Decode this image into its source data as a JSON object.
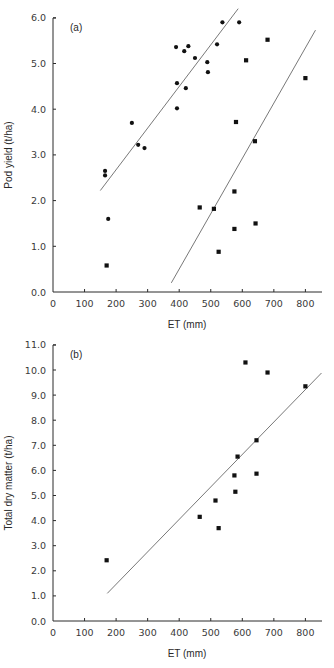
{
  "chart_data": [
    {
      "type": "scatter",
      "panel_label": "(a)",
      "xlabel": "ET (mm)",
      "ylabel": "Pod yield (t/ha)",
      "xlim": [
        0,
        850
      ],
      "ylim": [
        0,
        6.0
      ],
      "xticks": [
        0,
        100,
        200,
        300,
        400,
        500,
        600,
        700,
        800
      ],
      "xtick_labels": [
        "0",
        "100",
        "200",
        "300",
        "400",
        "500",
        "600",
        "700",
        "800"
      ],
      "yticks": [
        0,
        1,
        2,
        3,
        4,
        5,
        6
      ],
      "ytick_labels": [
        "0.0",
        "1.0",
        "2.0",
        "3.0",
        "4.0",
        "5.0",
        "6.0"
      ],
      "grid": false,
      "legend": null,
      "series": [
        {
          "name": "circles",
          "marker": "circle",
          "points": [
            [
              165,
              2.65
            ],
            [
              165,
              2.55
            ],
            [
              175,
              1.6
            ],
            [
              250,
              3.7
            ],
            [
              270,
              3.22
            ],
            [
              290,
              3.15
            ],
            [
              390,
              5.36
            ],
            [
              393,
              4.57
            ],
            [
              393,
              4.02
            ],
            [
              416,
              5.27
            ],
            [
              421,
              4.46
            ],
            [
              429,
              5.38
            ],
            [
              450,
              5.12
            ],
            [
              489,
              5.03
            ],
            [
              491,
              4.81
            ],
            [
              520,
              5.42
            ],
            [
              537,
              5.9
            ],
            [
              590,
              5.9
            ]
          ],
          "fit_line": [
            [
              150,
              2.22
            ],
            [
              587,
              6.2
            ]
          ]
        },
        {
          "name": "squares",
          "marker": "square",
          "points": [
            [
              170,
              0.58
            ],
            [
              465,
              1.85
            ],
            [
              510,
              1.82
            ],
            [
              525,
              0.88
            ],
            [
              575,
              2.2
            ],
            [
              575,
              1.38
            ],
            [
              580,
              3.72
            ],
            [
              612,
              5.07
            ],
            [
              640,
              3.3
            ],
            [
              642,
              1.5
            ],
            [
              680,
              5.52
            ],
            [
              800,
              4.68
            ]
          ],
          "fit_line": [
            [
              375,
              0.2
            ],
            [
              832,
              5.73
            ]
          ]
        }
      ]
    },
    {
      "type": "scatter",
      "panel_label": "(b)",
      "xlabel": "ET (mm)",
      "ylabel": "Total dry matter (t/ha)",
      "xlim": [
        0,
        850
      ],
      "ylim": [
        0,
        11.0
      ],
      "xticks": [
        0,
        100,
        200,
        300,
        400,
        500,
        600,
        700,
        800
      ],
      "xtick_labels": [
        "0",
        "100",
        "200",
        "300",
        "400",
        "500",
        "600",
        "700",
        "800"
      ],
      "yticks": [
        0,
        1,
        2,
        3,
        4,
        5,
        6,
        7,
        8,
        9,
        10,
        11
      ],
      "ytick_labels": [
        "0.0",
        "1.0",
        "2.0",
        "3.0",
        "4.0",
        "5.0",
        "6.0",
        "7.0",
        "8.0",
        "9.0",
        "10.0",
        "11.0"
      ],
      "grid": false,
      "legend": null,
      "series": [
        {
          "name": "squares",
          "marker": "square",
          "points": [
            [
              170,
              2.42
            ],
            [
              465,
              4.15
            ],
            [
              515,
              4.8
            ],
            [
              525,
              3.7
            ],
            [
              575,
              5.8
            ],
            [
              578,
              5.15
            ],
            [
              585,
              6.55
            ],
            [
              610,
              10.3
            ],
            [
              645,
              7.2
            ],
            [
              645,
              5.87
            ],
            [
              680,
              9.9
            ],
            [
              800,
              9.35
            ]
          ],
          "fit_line": [
            [
              172,
              1.1
            ],
            [
              851,
              9.88
            ]
          ]
        }
      ]
    }
  ],
  "layout": {
    "panels": [
      {
        "x0_px": 53,
        "x_scale": 0.3155,
        "y0_px": 292,
        "y_scale": 45.7,
        "y_top_px": 18,
        "x_end_px": 322
      },
      {
        "x0_px": 53,
        "x_scale": 0.3155,
        "y0_px": 621,
        "y_scale": 25.1,
        "y_top_px": 345,
        "x_end_px": 322
      }
    ]
  }
}
